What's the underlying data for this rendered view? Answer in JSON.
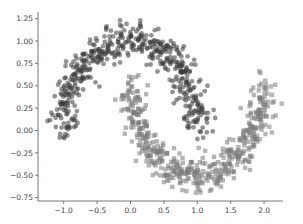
{
  "chart_data": {
    "type": "scatter",
    "title": "",
    "xlabel": "",
    "ylabel": "",
    "xlim": [
      -1.35,
      2.35
    ],
    "ylim": [
      -0.78,
      1.3
    ],
    "grid": false,
    "legend": null,
    "x_ticks": [
      -1.0,
      -0.5,
      0.0,
      0.5,
      1.0,
      1.5,
      2.0
    ],
    "x_tick_labels": [
      "−1.0",
      "−0.5",
      "0.0",
      "0.5",
      "1.0",
      "1.5",
      "2.0"
    ],
    "y_ticks": [
      1.25,
      1.0,
      0.75,
      0.5,
      0.25,
      0.0,
      -0.25,
      -0.5,
      -0.75
    ],
    "y_tick_labels": [
      "1.25",
      "1.00",
      "0.75",
      "0.50",
      "0.25",
      "0.00",
      "−0.25",
      "−0.50",
      "−0.75"
    ],
    "series": [
      {
        "name": "class 0 (upper moon)",
        "marker": "circle",
        "color": "#3a3a3a",
        "alpha": 0.55,
        "n_points": 500,
        "shape": "upper half circle: x = cos(t), y = sin(t), t in [0, pi]",
        "noise": 0.1,
        "sample_points": [
          [
            -1.0,
            0.05
          ],
          [
            -0.9,
            0.4
          ],
          [
            -0.7,
            0.72
          ],
          [
            -0.4,
            0.92
          ],
          [
            0.0,
            1.0
          ],
          [
            0.4,
            0.92
          ],
          [
            0.7,
            0.7
          ],
          [
            0.9,
            0.4
          ],
          [
            1.0,
            0.05
          ]
        ]
      },
      {
        "name": "class 1 (lower moon)",
        "marker": "square",
        "color": "#7a7a7a",
        "alpha": 0.55,
        "n_points": 500,
        "shape": "lower half circle: x = 1 - cos(t), y = 0.5 - sin(t), t in [0, pi]",
        "noise": 0.1,
        "sample_points": [
          [
            0.0,
            0.5
          ],
          [
            0.1,
            0.1
          ],
          [
            0.3,
            -0.2
          ],
          [
            0.6,
            -0.4
          ],
          [
            1.0,
            -0.5
          ],
          [
            1.4,
            -0.4
          ],
          [
            1.7,
            -0.2
          ],
          [
            1.9,
            0.1
          ],
          [
            2.0,
            0.5
          ]
        ]
      }
    ]
  },
  "plot": {
    "area": {
      "left": 38,
      "right": 283,
      "top": 12,
      "bottom": 201
    },
    "x_px": {
      "ref_val": 0.0,
      "ref_px": 130.5,
      "px_per_unit": 66.8
    },
    "y_px": {
      "ref_val": 0.0,
      "ref_px": 130.5,
      "px_per_unit": 89.5
    },
    "spine_color": "#555555",
    "seed": 7
  }
}
